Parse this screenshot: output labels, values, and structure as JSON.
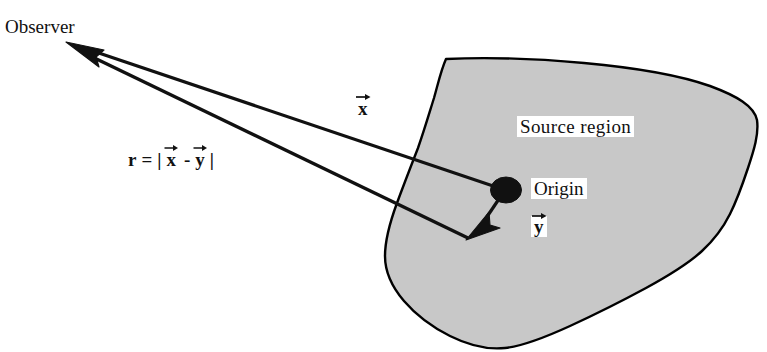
{
  "figure": {
    "type": "physics-diagram",
    "labels": {
      "observer": "Observer",
      "source_region": "Source region",
      "origin": "Origin"
    },
    "vectors": {
      "x": {
        "symbol": "x",
        "accent": "right-arrow",
        "from": "origin",
        "to": "observer"
      },
      "y": {
        "symbol": "y",
        "accent": "right-arrow",
        "from": "origin",
        "to": "source-point"
      }
    },
    "equation": {
      "lhs": "r",
      "equals": "=",
      "open_bar": "|",
      "term1": "x",
      "minus": "-",
      "term2": "y",
      "close_bar": "|"
    },
    "colors": {
      "ink": "#111111",
      "region_fill": "#c8c8c8",
      "region_stroke": "#000000",
      "background": "#ffffff"
    }
  },
  "geometry": {
    "observer_point": [
      70,
      44
    ],
    "origin_point": [
      505,
      190
    ],
    "source_point": [
      468,
      238
    ],
    "region_bounds": {
      "left": 385,
      "top": 58,
      "right": 757,
      "bottom": 349
    }
  }
}
